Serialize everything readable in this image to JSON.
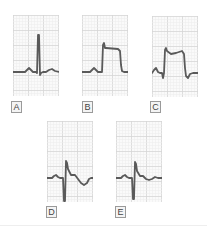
{
  "figure": {
    "colors": {
      "trace": "#5a5a5a",
      "grid_major": "#d6d6d6",
      "grid_minor": "#ececec",
      "paper": "#fafafa"
    }
  },
  "panels": [
    {
      "id": "A",
      "label": "A",
      "pattern": "normal-pqrst",
      "points": "0,57 12,57 14,55 16,53 18,55 20,57 23,57 24,58 25,20 26,20 27,60 28,58 30,57 33,57 36,55 39,54 42,56 46,57"
    },
    {
      "id": "B",
      "label": "B",
      "pattern": "st-elevation-tombstone",
      "points": "0,57 8,57 10,55 12,53 14,55 16,57 20,57 21,30 22,28 23,33 24,33 36,34 38,36 39,50 40,56 42,57 46,57"
    },
    {
      "id": "C",
      "label": "C",
      "pattern": "st-elevation-with-q-and-t-inversion",
      "points": "0,57 2,54 4,52 6,56 8,57 10,57 11,62 12,57 13,34 14,32 15,35 19,38 24,37 30,35 32,38 33,52 34,60 36,62 38,58 41,57 46,57"
    },
    {
      "id": "D",
      "label": "D",
      "pattern": "q-wave-with-deep-t-inversion",
      "points": "0,57 5,57 7,55 9,54 11,56 13,57 16,57 17,80 18,80 19,40 20,42 21,48 24,54 28,54 31,58 34,62 37,64 40,62 42,58 44,57 46,57"
    },
    {
      "id": "E",
      "label": "E",
      "pattern": "q-wave-with-shallow-t-inversion",
      "points": "0,57 5,57 7,55 9,54 11,56 13,57 16,57 17,78 18,78 19,41 20,43 21,50 24,55 27,55 30,58 33,59 36,58 39,56 42,57 46,57"
    }
  ]
}
